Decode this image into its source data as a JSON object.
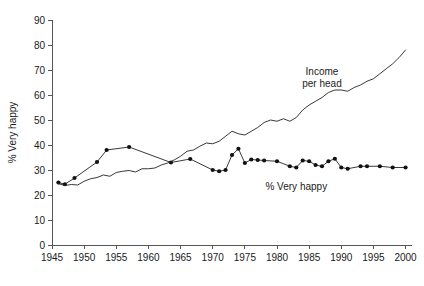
{
  "chart_data": {
    "type": "line",
    "title": "",
    "xlabel": "",
    "ylabel": "% Very happy",
    "xlim": [
      1945,
      2001
    ],
    "ylim": [
      0,
      90
    ],
    "grid": false,
    "legend_position": "inline-annotations",
    "xticks": [
      "1945",
      "1950",
      "1955",
      "1960",
      "1965",
      "1970",
      "1975",
      "1980",
      "1985",
      "1990",
      "1995",
      "2000"
    ],
    "xtick_values": [
      1945,
      1950,
      1955,
      1960,
      1965,
      1970,
      1975,
      1980,
      1985,
      1990,
      1995,
      2000
    ],
    "yticks": [
      "0",
      "10",
      "20",
      "30",
      "40",
      "50",
      "60",
      "70",
      "80",
      "90"
    ],
    "ytick_values": [
      0,
      10,
      20,
      30,
      40,
      50,
      60,
      70,
      80,
      90
    ],
    "annotations": [
      {
        "text": "Income per head",
        "lines": [
          "Income",
          "per head"
        ],
        "x": 1987,
        "y": 68
      },
      {
        "text": "% Very happy",
        "lines": [
          "% Very happy"
        ],
        "x": 1983,
        "y": 22
      }
    ],
    "series": [
      {
        "name": "% Very happy",
        "marker": "filled-circle",
        "x": [
          1946,
          1947,
          1948.5,
          1952,
          1953.5,
          1957,
          1963.5,
          1966.5,
          1970,
          1971,
          1972,
          1973,
          1974,
          1975,
          1976,
          1977,
          1978,
          1980,
          1982,
          1983,
          1984,
          1985,
          1986,
          1987,
          1988,
          1989,
          1990,
          1991,
          1993,
          1994,
          1996,
          1998,
          2000
        ],
        "values": [
          25,
          24.3,
          26.8,
          33.2,
          38,
          39.2,
          33,
          34.4,
          30,
          29.5,
          30,
          36,
          38.5,
          32.8,
          34.2,
          34,
          33.8,
          33.5,
          31.5,
          31,
          33.8,
          33.5,
          32,
          31.5,
          33.5,
          34.5,
          31,
          30.5,
          31.5,
          31.5,
          31.5,
          31,
          31
        ]
      },
      {
        "name": "Income per head",
        "marker": "none",
        "x": [
          1946,
          1947,
          1948,
          1949,
          1950,
          1951,
          1952,
          1953,
          1954,
          1955,
          1956,
          1957,
          1958,
          1959,
          1960,
          1961,
          1962,
          1963,
          1964,
          1965,
          1966,
          1967,
          1968,
          1969,
          1970,
          1971,
          1972,
          1973,
          1974,
          1975,
          1976,
          1977,
          1978,
          1979,
          1980,
          1981,
          1982,
          1983,
          1984,
          1985,
          1986,
          1987,
          1988,
          1989,
          1990,
          1991,
          1992,
          1993,
          1994,
          1995,
          1996,
          1997,
          1998,
          1999,
          2000
        ],
        "values": [
          24.5,
          23.8,
          24.2,
          24,
          25.5,
          26.5,
          27,
          28,
          27.5,
          29,
          29.5,
          29.8,
          29.2,
          30.5,
          30.5,
          30.8,
          32,
          32.8,
          34,
          35.5,
          37.5,
          38,
          39.5,
          40.8,
          40.5,
          41.5,
          43.5,
          45.5,
          44.5,
          44,
          45.5,
          47,
          49,
          50,
          49.5,
          50.5,
          49.5,
          51,
          54,
          56,
          57.5,
          59,
          61,
          62,
          62,
          61.5,
          63,
          64,
          65.5,
          66.5,
          68.5,
          70.5,
          72.5,
          75,
          78
        ]
      }
    ]
  }
}
